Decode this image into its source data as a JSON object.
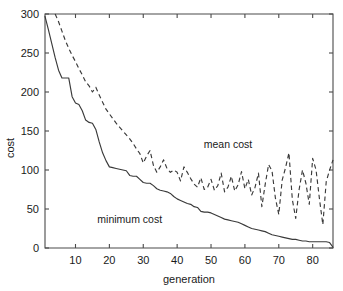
{
  "chart_data": {
    "type": "line",
    "title": "",
    "xlabel": "generation",
    "ylabel": "cost",
    "xlim": [
      1,
      86
    ],
    "ylim": [
      0,
      300
    ],
    "xticks": [
      10,
      20,
      30,
      40,
      50,
      60,
      70,
      80
    ],
    "yticks": [
      0,
      50,
      100,
      150,
      200,
      250,
      300
    ],
    "grid": false,
    "legend_position": "inline-annotations",
    "annotations": [
      {
        "text": "mean cost",
        "x": 55,
        "y": 128
      },
      {
        "text": "minimum cost",
        "x": 26,
        "y": 32
      }
    ],
    "series": [
      {
        "name": "minimum cost",
        "style": "solid",
        "x": [
          1,
          2,
          3,
          4,
          5,
          6,
          7,
          8,
          9,
          10,
          11,
          12,
          13,
          14,
          15,
          16,
          17,
          18,
          19,
          20,
          21,
          22,
          23,
          24,
          25,
          26,
          27,
          28,
          29,
          30,
          31,
          32,
          33,
          34,
          35,
          36,
          37,
          38,
          39,
          40,
          41,
          42,
          43,
          44,
          45,
          46,
          47,
          48,
          49,
          50,
          51,
          52,
          53,
          54,
          55,
          56,
          57,
          58,
          59,
          60,
          61,
          62,
          63,
          64,
          65,
          66,
          67,
          68,
          69,
          70,
          71,
          72,
          73,
          74,
          75,
          76,
          77,
          78,
          79,
          80,
          81,
          82,
          83,
          84,
          85,
          86
        ],
        "values": [
          297,
          280,
          262,
          244,
          228,
          218,
          218,
          218,
          194,
          186,
          184,
          176,
          164,
          161,
          160,
          152,
          136,
          122,
          112,
          104,
          103,
          102,
          101,
          100,
          99,
          93,
          92,
          92,
          88,
          84,
          83,
          83,
          80,
          76,
          74,
          73,
          72,
          70,
          66,
          63,
          61,
          59,
          57,
          56,
          53,
          52,
          47,
          46,
          46,
          45,
          43,
          41,
          39,
          37,
          36,
          35,
          34,
          33,
          31,
          29,
          27,
          25,
          24,
          23,
          22,
          21,
          19,
          17,
          16,
          15,
          14,
          13,
          12,
          11,
          11,
          10,
          9,
          9,
          8,
          8,
          8,
          8,
          8,
          8,
          7,
          1
        ]
      },
      {
        "name": "mean cost",
        "style": "dashed",
        "x": [
          4,
          5,
          6,
          7,
          8,
          9,
          10,
          11,
          12,
          13,
          14,
          15,
          16,
          17,
          18,
          19,
          20,
          21,
          22,
          23,
          24,
          25,
          26,
          27,
          28,
          29,
          30,
          31,
          32,
          33,
          34,
          35,
          36,
          37,
          38,
          39,
          40,
          41,
          42,
          43,
          44,
          45,
          46,
          47,
          48,
          49,
          50,
          51,
          52,
          53,
          54,
          55,
          56,
          57,
          58,
          59,
          60,
          61,
          62,
          63,
          64,
          65,
          66,
          67,
          68,
          69,
          70,
          71,
          72,
          73,
          74,
          75,
          76,
          77,
          78,
          79,
          80,
          81,
          82,
          83,
          84,
          85,
          86
        ],
        "values": [
          300,
          290,
          278,
          266,
          256,
          247,
          239,
          230,
          222,
          213,
          208,
          200,
          206,
          196,
          187,
          178,
          172,
          166,
          160,
          155,
          150,
          145,
          140,
          134,
          127,
          121,
          109,
          118,
          125,
          106,
          97,
          104,
          113,
          102,
          97,
          100,
          97,
          86,
          104,
          97,
          89,
          82,
          78,
          90,
          75,
          78,
          88,
          74,
          80,
          96,
          72,
          78,
          92,
          73,
          81,
          98,
          76,
          88,
          68,
          78,
          96,
          53,
          82,
          107,
          99,
          64,
          43,
          87,
          103,
          122,
          62,
          38,
          75,
          100,
          83,
          56,
          115,
          100,
          63,
          30,
          85,
          100,
          113
        ]
      }
    ]
  },
  "axes": {
    "y_tick_labels": [
      "0",
      "50",
      "100",
      "150",
      "200",
      "250",
      "300"
    ],
    "x_tick_labels": [
      "10",
      "20",
      "30",
      "40",
      "50",
      "60",
      "70",
      "80"
    ],
    "x_title": "generation",
    "y_title": "cost"
  },
  "labels": {
    "mean": "mean cost",
    "minimum": "minimum cost"
  },
  "colors": {
    "background": "#ffffff",
    "axis": "#4a4a4a",
    "line": "#3a3a3a",
    "text": "#1a1a1a"
  }
}
